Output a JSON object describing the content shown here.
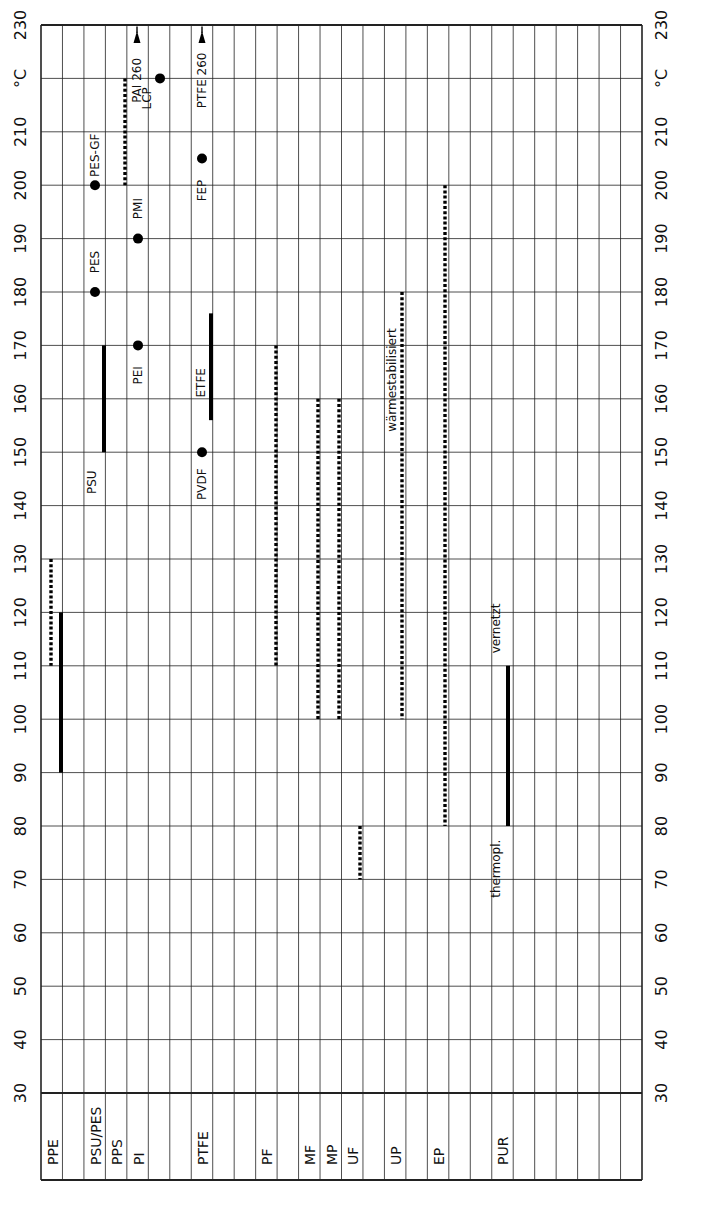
{
  "chart_data": {
    "type": "range",
    "title": "",
    "orientation": "rotated-90",
    "ylabel": "°C",
    "yrange": [
      30,
      230
    ],
    "ytick_step": 10,
    "ytick_labels": [
      "30",
      "40",
      "50",
      "60",
      "70",
      "80",
      "90",
      "100",
      "110",
      "120",
      "130",
      "140",
      "150",
      "160",
      "170",
      "180",
      "190",
      "200",
      "210",
      "°C",
      "230"
    ],
    "columns_total": 28,
    "categories": [
      {
        "label": "PPE",
        "col": 0
      },
      {
        "label": "PSU/PES",
        "col": 2
      },
      {
        "label": "PPS",
        "col": 3
      },
      {
        "label": "PI",
        "col": 4
      },
      {
        "label": "PTFE",
        "col": 7
      },
      {
        "label": "PF",
        "col": 10
      },
      {
        "label": "MF",
        "col": 12
      },
      {
        "label": "MP",
        "col": 13
      },
      {
        "label": "UF",
        "col": 14
      },
      {
        "label": "UP",
        "col": 16
      },
      {
        "label": "EP",
        "col": 18
      },
      {
        "label": "PUR",
        "col": 21
      }
    ],
    "series": [
      {
        "name": "PPE dotted",
        "category": "PPE",
        "style": "dotted",
        "x": 51,
        "from": 110,
        "to": 130
      },
      {
        "name": "PPE solid",
        "category": "PPE",
        "style": "solid",
        "x": 61,
        "from": 90,
        "to": 120
      },
      {
        "name": "PSU",
        "category": "PSU/PES",
        "style": "solid",
        "x": 104,
        "from": 150,
        "to": 170,
        "label": "PSU"
      },
      {
        "name": "PAI",
        "category": "PPS",
        "style": "dotted",
        "x": 125,
        "from": 200,
        "to": 220
      },
      {
        "name": "ETFE",
        "category": "PTFE",
        "style": "solid",
        "x": 211,
        "from": 156,
        "to": 176,
        "label": "ETFE"
      },
      {
        "name": "PF",
        "category": "PF",
        "style": "dotted",
        "x": 276,
        "from": 110,
        "to": 170
      },
      {
        "name": "MF",
        "category": "MF",
        "style": "dotted",
        "x": 318,
        "from": 100,
        "to": 160
      },
      {
        "name": "MP",
        "category": "MP",
        "style": "dotted",
        "x": 339,
        "from": 100,
        "to": 160
      },
      {
        "name": "UF",
        "category": "UF",
        "style": "dotted",
        "x": 360,
        "from": 70,
        "to": 80
      },
      {
        "name": "UP",
        "category": "UP",
        "style": "dotted",
        "x": 402,
        "from": 100,
        "to": 180,
        "label": "wärmestabilisiert"
      },
      {
        "name": "EP",
        "category": "EP",
        "style": "dotted",
        "x": 445,
        "from": 80,
        "to": 200
      },
      {
        "name": "PUR",
        "category": "PUR",
        "style": "solid",
        "x": 508,
        "from": 80,
        "to": 110,
        "label_top": "vernetzt",
        "label_bottom": "thermopl."
      }
    ],
    "points": [
      {
        "label": "PES",
        "x": 95,
        "value": 180
      },
      {
        "label": "PES-GF",
        "x": 95,
        "value": 200
      },
      {
        "label": "PEI",
        "x": 138,
        "value": 170
      },
      {
        "label": "PMI",
        "x": 138,
        "value": 190
      },
      {
        "label": "LCP",
        "x": 160,
        "value": 220
      },
      {
        "label": "PVDF",
        "x": 202,
        "value": 150
      },
      {
        "label": "FEP",
        "x": 202,
        "value": 205
      }
    ],
    "arrows": [
      {
        "label": "PAI 260",
        "x": 137,
        "value": 260
      },
      {
        "label": "PTFE 260",
        "x": 202,
        "value": 260
      }
    ]
  }
}
